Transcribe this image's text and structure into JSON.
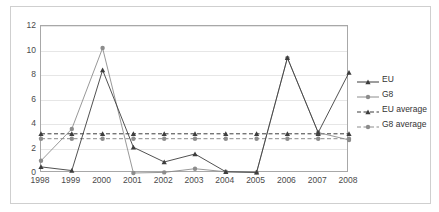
{
  "chart_data": {
    "type": "line",
    "title": "",
    "xlabel": "",
    "ylabel": "",
    "categories": [
      "1998",
      "1999",
      "2000",
      "2001",
      "2002",
      "2003",
      "2004",
      "2005",
      "2006",
      "2007",
      "2008"
    ],
    "x_tick_labels": [
      "1998",
      "1999",
      "2000",
      "2001",
      "2002",
      "2003",
      "2004",
      "2005",
      "2006",
      "2007",
      "2008"
    ],
    "y_tick_labels": [
      "0",
      "2",
      "4",
      "6",
      "8",
      "10",
      "12"
    ],
    "y_ticks": [
      0,
      2,
      4,
      6,
      8,
      10,
      12
    ],
    "ylim": [
      0,
      12
    ],
    "grid": "horizontal",
    "legend_position": "right",
    "series": [
      {
        "name": "EU",
        "style": "solid",
        "marker": "triangle",
        "color": "#3d3d3d",
        "values": [
          0.5,
          0.2,
          8.4,
          2.1,
          0.9,
          1.55,
          0.1,
          0.05,
          9.4,
          3.3,
          8.2
        ]
      },
      {
        "name": "G8",
        "style": "solid",
        "marker": "circle",
        "color": "#8c8c8c",
        "values": [
          1.0,
          3.6,
          10.2,
          0.0,
          0.05,
          0.35,
          0.1,
          0.05,
          9.4,
          3.3,
          2.7
        ]
      },
      {
        "name": "EU average",
        "style": "dashed",
        "marker": "triangle",
        "color": "#3d3d3d",
        "constant": 3.2,
        "values": [
          3.2,
          3.2,
          3.2,
          3.2,
          3.2,
          3.2,
          3.2,
          3.2,
          3.2,
          3.2,
          3.2
        ]
      },
      {
        "name": "G8 average",
        "style": "dashed",
        "marker": "circle",
        "color": "#8c8c8c",
        "constant": 2.8,
        "values": [
          2.8,
          2.8,
          2.8,
          2.8,
          2.8,
          2.8,
          2.8,
          2.8,
          2.8,
          2.8,
          2.8
        ]
      }
    ]
  },
  "legend": {
    "items": [
      {
        "label": "EU"
      },
      {
        "label": "G8"
      },
      {
        "label": "EU average"
      },
      {
        "label": "G8 average"
      }
    ]
  },
  "colors": {
    "eu": "#3d3d3d",
    "g8": "#8c8c8c",
    "grid": "#e6e6e6",
    "axis": "#a8a8a8",
    "frame": "#cfcfcf",
    "text": "#4a4a4a",
    "background": "#ffffff"
  }
}
